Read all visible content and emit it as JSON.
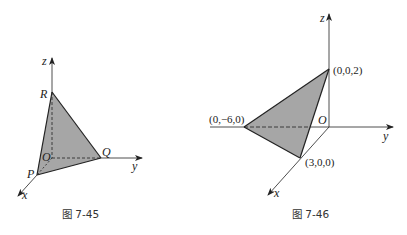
{
  "figures": [
    {
      "id": "fig-7-45",
      "caption": "图 7-45",
      "axes": {
        "x": "x",
        "y": "y",
        "z": "z"
      },
      "origin_label": "O",
      "vertices": [
        {
          "name": "R",
          "label": "R",
          "axis": "z"
        },
        {
          "name": "Q",
          "label": "Q",
          "axis": "y"
        },
        {
          "name": "P",
          "label": "P",
          "axis": "x"
        }
      ],
      "fill_color": "#a6a6a6"
    },
    {
      "id": "fig-7-46",
      "caption": "图 7-46",
      "axes": {
        "x": "x",
        "y": "y",
        "z": "z"
      },
      "origin_label": "O",
      "vertices": [
        {
          "name": "z-intercept",
          "label": "(0,0,2)",
          "coords": [
            0,
            0,
            2
          ]
        },
        {
          "name": "y-intercept",
          "label": "(0,−6,0)",
          "coords": [
            0,
            -6,
            0
          ]
        },
        {
          "name": "x-intercept",
          "label": "(3,0,0)",
          "coords": [
            3,
            0,
            0
          ]
        }
      ],
      "fill_color": "#a6a6a6"
    }
  ],
  "colors": {
    "line": "#222222",
    "fill": "#a6a6a6",
    "background": "#ffffff"
  }
}
